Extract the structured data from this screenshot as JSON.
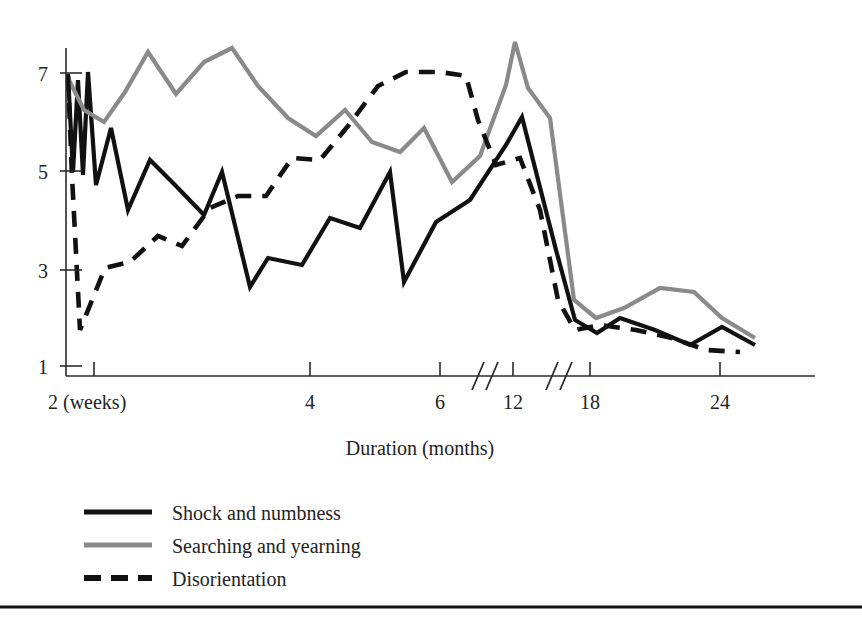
{
  "chart_data": {
    "type": "line",
    "title": "",
    "xlabel": "Duration (months)",
    "ylabel": "",
    "grid": false,
    "legend_position": "bottom-left",
    "x_ticks": [
      {
        "label": "2 (weeks)",
        "x": 2,
        "px": 94
      },
      {
        "label": "4",
        "x": 4,
        "px": 310
      },
      {
        "label": "6",
        "x": 6,
        "px": 440
      },
      {
        "label": "12",
        "x": 12,
        "px": 513
      },
      {
        "label": "18",
        "x": 18,
        "px": 590
      },
      {
        "label": "24",
        "x": 24,
        "px": 720
      }
    ],
    "axis_breaks_px": [
      478,
      552
    ],
    "y_ticks": [
      {
        "label": "7",
        "value": 7,
        "px": 73
      },
      {
        "label": "5",
        "value": 5,
        "px": 171
      },
      {
        "label": "3",
        "value": 3,
        "px": 270
      },
      {
        "label": "1",
        "value": 1,
        "px": 366
      }
    ],
    "ylim": [
      1,
      7.8
    ],
    "xlim_px": [
      66,
      815
    ],
    "series": [
      {
        "name": "Shock and numbness",
        "color": "#111111",
        "style": "solid",
        "width": 4.2,
        "points_px": [
          [
            68,
            74
          ],
          [
            73,
            172
          ],
          [
            78,
            80
          ],
          [
            83,
            175
          ],
          [
            88,
            72
          ],
          [
            96,
            185
          ],
          [
            111,
            128
          ],
          [
            128,
            210
          ],
          [
            150,
            160
          ],
          [
            176,
            186
          ],
          [
            204,
            215
          ],
          [
            222,
            172
          ],
          [
            250,
            287
          ],
          [
            268,
            258
          ],
          [
            302,
            265
          ],
          [
            330,
            218
          ],
          [
            360,
            228
          ],
          [
            390,
            172
          ],
          [
            404,
            282
          ],
          [
            436,
            222
          ],
          [
            470,
            200
          ],
          [
            506,
            145
          ],
          [
            522,
            117
          ],
          [
            556,
            250
          ],
          [
            575,
            320
          ],
          [
            597,
            333
          ],
          [
            620,
            318
          ],
          [
            655,
            330
          ],
          [
            690,
            345
          ],
          [
            722,
            327
          ],
          [
            755,
            345
          ]
        ]
      },
      {
        "name": "Searching and yearning",
        "color": "#8a8a8a",
        "style": "solid",
        "width": 4.2,
        "points_px": [
          [
            68,
            78
          ],
          [
            84,
            110
          ],
          [
            104,
            122
          ],
          [
            125,
            92
          ],
          [
            148,
            52
          ],
          [
            176,
            94
          ],
          [
            204,
            62
          ],
          [
            232,
            48
          ],
          [
            258,
            86
          ],
          [
            288,
            118
          ],
          [
            316,
            136
          ],
          [
            345,
            110
          ],
          [
            372,
            142
          ],
          [
            400,
            152
          ],
          [
            424,
            128
          ],
          [
            452,
            182
          ],
          [
            480,
            156
          ],
          [
            506,
            85
          ],
          [
            515,
            42
          ],
          [
            528,
            88
          ],
          [
            550,
            118
          ],
          [
            574,
            300
          ],
          [
            596,
            318
          ],
          [
            624,
            308
          ],
          [
            660,
            288
          ],
          [
            694,
            292
          ],
          [
            722,
            318
          ],
          [
            755,
            338
          ]
        ]
      },
      {
        "name": "Disorientation",
        "color": "#111111",
        "style": "dashed",
        "width": 4.6,
        "dash": "16 11",
        "points_px": [
          [
            68,
            76
          ],
          [
            72,
            176
          ],
          [
            80,
            330
          ],
          [
            105,
            268
          ],
          [
            130,
            262
          ],
          [
            158,
            236
          ],
          [
            182,
            246
          ],
          [
            210,
            208
          ],
          [
            238,
            196
          ],
          [
            266,
            196
          ],
          [
            292,
            158
          ],
          [
            320,
            160
          ],
          [
            348,
            126
          ],
          [
            378,
            86
          ],
          [
            406,
            72
          ],
          [
            440,
            72
          ],
          [
            466,
            76
          ],
          [
            478,
            120
          ],
          [
            496,
            165
          ],
          [
            520,
            158
          ],
          [
            540,
            210
          ],
          [
            558,
            300
          ],
          [
            575,
            330
          ],
          [
            600,
            325
          ],
          [
            636,
            330
          ],
          [
            672,
            338
          ],
          [
            706,
            350
          ],
          [
            740,
            352
          ]
        ]
      }
    ]
  },
  "legend": {
    "items": [
      {
        "label": "Shock and numbness",
        "swatch": "solid-black-line",
        "y": 512
      },
      {
        "label": "Searching and yearning",
        "swatch": "solid-gray-line",
        "y": 545
      },
      {
        "label": "Disorientation",
        "swatch": "dashed-black-line",
        "y": 578
      }
    ]
  },
  "colors": {
    "shock": "#111111",
    "searching": "#8a8a8a",
    "disorientation": "#111111",
    "axis": "#2b2b2b",
    "text": "#232323"
  }
}
